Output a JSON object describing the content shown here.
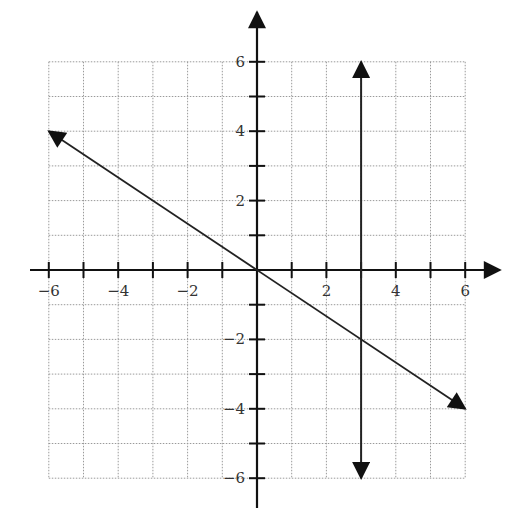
{
  "chart_data": {
    "type": "line",
    "title": "",
    "xlabel": "",
    "ylabel": "",
    "xlim": [
      -6,
      6
    ],
    "ylim": [
      -6,
      6
    ],
    "grid": true,
    "grid_step": 1,
    "x_tick_labels": [
      "−6",
      "−4",
      "−2",
      "2",
      "4",
      "6"
    ],
    "x_tick_values": [
      -6,
      -4,
      -2,
      2,
      4,
      6
    ],
    "y_tick_labels": [
      "6",
      "4",
      "2",
      "−2",
      "−4",
      "−6"
    ],
    "y_tick_values": [
      6,
      4,
      2,
      -2,
      -4,
      -6
    ],
    "series": [
      {
        "name": "y = -2/3 x",
        "kind": "line-with-arrows",
        "points": [
          [
            -6,
            4
          ],
          [
            6,
            -4
          ]
        ]
      },
      {
        "name": "x = 3",
        "kind": "vertical-line-with-arrows",
        "points": [
          [
            3,
            6
          ],
          [
            3,
            -6
          ]
        ]
      }
    ],
    "colors": {
      "axis": "#111111",
      "grid": "#9a9a9a",
      "line": "#222222"
    }
  }
}
